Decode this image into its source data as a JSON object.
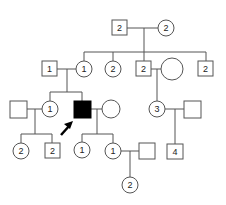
{
  "colors": {
    "line": "#555555",
    "affected": "#000000",
    "unaffected": "#ffffff"
  },
  "generations": {
    "I": [
      {
        "id": "I-1",
        "shape": "square",
        "label": "2"
      },
      {
        "id": "I-2",
        "shape": "circle",
        "label": "2"
      }
    ],
    "II": [
      {
        "id": "II-spouse",
        "shape": "square",
        "label": "1"
      },
      {
        "id": "II-1",
        "shape": "circle",
        "label": "1"
      },
      {
        "id": "II-2",
        "shape": "circle",
        "label": "2"
      },
      {
        "id": "II-3",
        "shape": "square",
        "label": "2"
      },
      {
        "id": "II-3-spouse",
        "shape": "circle",
        "label": ""
      },
      {
        "id": "II-4",
        "shape": "square",
        "label": "2"
      }
    ],
    "III": [
      {
        "id": "III-spouse",
        "shape": "square",
        "label": ""
      },
      {
        "id": "III-1",
        "shape": "circle",
        "label": "1"
      },
      {
        "id": "III-2",
        "shape": "square",
        "label": "",
        "affected": true,
        "proband": true
      },
      {
        "id": "III-2-spouse",
        "shape": "circle",
        "label": ""
      },
      {
        "id": "III-3",
        "shape": "circle",
        "label": "3"
      },
      {
        "id": "III-3-spouse",
        "shape": "square",
        "label": ""
      }
    ],
    "IV": [
      {
        "id": "IV-1",
        "shape": "circle",
        "label": "2"
      },
      {
        "id": "IV-2",
        "shape": "square",
        "label": "2"
      },
      {
        "id": "IV-3",
        "shape": "circle",
        "label": "1"
      },
      {
        "id": "IV-4",
        "shape": "circle",
        "label": "1"
      },
      {
        "id": "IV-4-spouse",
        "shape": "square",
        "label": ""
      },
      {
        "id": "IV-5",
        "shape": "square",
        "label": "4"
      }
    ],
    "V": [
      {
        "id": "V-1",
        "shape": "circle",
        "label": "2"
      }
    ]
  },
  "proband_marker": "arrow"
}
